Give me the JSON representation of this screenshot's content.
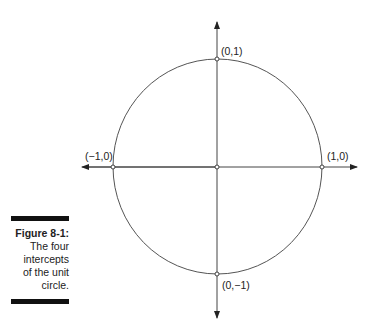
{
  "figure": {
    "number": "Figure 8-1:",
    "caption_lines": [
      "The four",
      "intercepts",
      "of the unit",
      "circle."
    ]
  },
  "diagram": {
    "type": "unit-circle",
    "labels": {
      "top": "(0,1)",
      "bottom": "(0,−1)",
      "left": "(−1,0)",
      "right": "(1,0)"
    },
    "colors": {
      "stroke": "#333333",
      "text": "#222222"
    }
  }
}
